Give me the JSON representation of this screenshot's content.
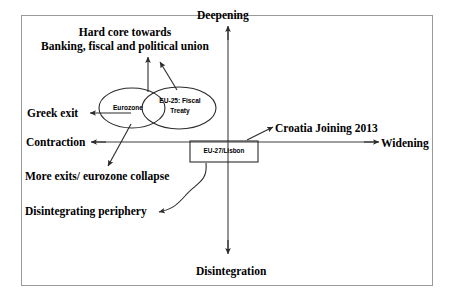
{
  "diagram": {
    "title_text": "",
    "frame": {
      "border_color": "#9a9a9a"
    },
    "axes": {
      "vertical": {
        "top_label": "Deepening",
        "bottom_label": "Disintegration"
      },
      "horizontal": {
        "left_label": "Contraction",
        "right_label": "Widening"
      },
      "line_color": "#3f3f3f"
    },
    "nodes": [
      {
        "id": "eurozone",
        "shape": "ellipse",
        "label": "Eurozone"
      },
      {
        "id": "eu25-fiscal-treaty",
        "shape": "ellipse",
        "label": "EU-25: Fiscal Treaty",
        "label_line1": "EU-25: Fiscal",
        "label_line2": "Treaty"
      },
      {
        "id": "eu27-lisbon",
        "shape": "rectangle",
        "label": "EU-27/Lisbon"
      }
    ],
    "annotations": [
      {
        "id": "hard-core",
        "text": "Hard core towards Banking, fiscal and political union",
        "line1": "Hard core towards",
        "line2": "Banking, fiscal and political union"
      },
      {
        "id": "greek-exit",
        "text": "Greek exit"
      },
      {
        "id": "croatia-joining",
        "text": "Croatia Joining 2013"
      },
      {
        "id": "more-exits",
        "text": "More exits/ eurozone collapse"
      },
      {
        "id": "disintegrating-periphery",
        "text": "Disintegrating periphery"
      }
    ]
  }
}
